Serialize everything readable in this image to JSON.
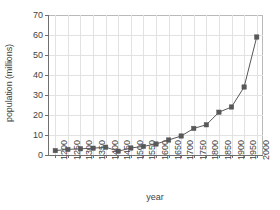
{
  "chart_data": {
    "type": "line",
    "title": "",
    "xlabel": "year",
    "ylabel": "population (millions)",
    "xlim": [
      1175,
      2025
    ],
    "ylim": [
      0,
      70
    ],
    "grid": true,
    "legend": false,
    "marker": "square",
    "line_color": "#58585a",
    "marker_color": "#58585a",
    "grid_color": "#e2e2e2",
    "axis_color": "#6f6f6f",
    "x_tick_labels": [
      "1200",
      "1250",
      "1300",
      "1350",
      "1400",
      "1450",
      "1500",
      "1550",
      "1600",
      "1650",
      "1700",
      "1750",
      "1800",
      "1850",
      "1900",
      "1950",
      "2000"
    ],
    "y_tick_labels": [
      "0",
      "10",
      "20",
      "30",
      "40",
      "50",
      "60",
      "70"
    ],
    "x": [
      1200,
      1250,
      1300,
      1350,
      1400,
      1450,
      1500,
      1550,
      1600,
      1650,
      1700,
      1750,
      1800,
      1850,
      1900,
      1950,
      2000
    ],
    "values": [
      2.2,
      2.8,
      3.1,
      3.4,
      3.9,
      1.9,
      3.5,
      4.3,
      5.5,
      7.5,
      9.5,
      13.3,
      15.1,
      21.4,
      24.0,
      34.0,
      59.0
    ]
  }
}
